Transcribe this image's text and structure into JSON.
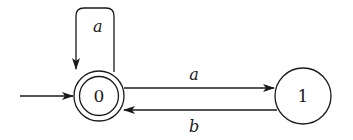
{
  "diagram": {
    "type": "finite-automaton",
    "colors": {
      "stroke": "#1a1a1a",
      "background": "#ffffff"
    },
    "states": [
      {
        "id": "0",
        "label": "0",
        "accepting": true,
        "initial": true
      },
      {
        "id": "1",
        "label": "1",
        "accepting": false,
        "initial": false
      }
    ],
    "transitions": [
      {
        "from": "0",
        "to": "0",
        "label": "a"
      },
      {
        "from": "0",
        "to": "1",
        "label": "a"
      },
      {
        "from": "1",
        "to": "0",
        "label": "b"
      }
    ]
  }
}
